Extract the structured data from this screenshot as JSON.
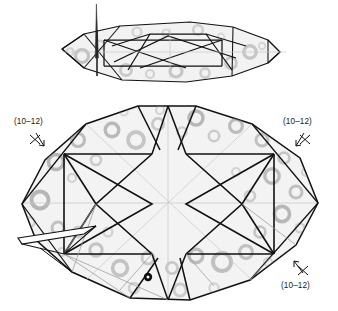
{
  "figure": {
    "background": "#ffffff",
    "line_color": "#111111",
    "facet_fill": "#f2f2f2",
    "ring_color": "#8a8a8a",
    "axis_color": "#c9c9c9",
    "marker_dot_color": "#0d0d0d"
  },
  "views": {
    "top": {
      "name": "edge-on-projection",
      "has_spike": true
    },
    "bottom": {
      "name": "face-on-projection",
      "has_dot_marker": true
    }
  },
  "labels": [
    {
      "id": "label-top-left",
      "text": "(10–12)",
      "x": 14,
      "y": 120,
      "marker": "arrow-down-right",
      "mx": 28,
      "my": 133
    },
    {
      "id": "label-top-right",
      "text": "(10–12)",
      "x": 283,
      "y": 120,
      "marker": "arrow-down-left",
      "mx": 290,
      "my": 133
    },
    {
      "id": "label-bottom-right",
      "text": "(10–12)",
      "x": 281,
      "y": 283,
      "marker": "arrow-up-left",
      "mx": 288,
      "my": 262
    }
  ],
  "rings": {
    "note": "ring-shaped surface etch textures",
    "count": 54
  }
}
